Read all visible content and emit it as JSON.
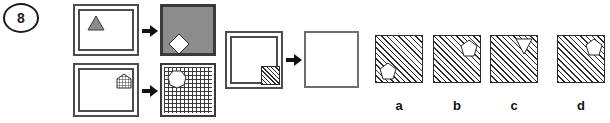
{
  "question": {
    "number": "8",
    "type": "visual-analogy-matrix"
  },
  "examples": [
    {
      "id": "example-1",
      "source": {
        "frame": "double-border-square",
        "fill": "white",
        "shape": "triangle-up",
        "shape_fill": "gray",
        "shape_position": "upper-left"
      },
      "target": {
        "frame": "thick-border-square",
        "fill": "gray",
        "shape": "diamond",
        "shape_fill": "white",
        "shape_position": "lower-left"
      },
      "relation": "arrow-right"
    },
    {
      "id": "example-2",
      "source": {
        "frame": "double-border-square",
        "fill": "white",
        "shape": "pentagon-grid",
        "shape_fill": "grid",
        "shape_position": "upper-right"
      },
      "target": {
        "frame": "thin-border-square",
        "fill": "grid",
        "shape": "heptagon",
        "shape_fill": "white",
        "shape_position": "upper-left"
      },
      "relation": "arrow-right"
    }
  ],
  "prompt": {
    "id": "prompt-pair",
    "source": {
      "frame": "double-border-square",
      "fill": "white",
      "shape": "square-hatched",
      "shape_fill": "diagonal-hatch",
      "shape_position": "lower-right"
    },
    "target": {
      "frame": "thin-border-square",
      "fill": "white",
      "shape": "none",
      "label": "?"
    },
    "relation": "arrow-right"
  },
  "options": [
    {
      "label": "a",
      "fill": "diagonal-hatch",
      "shape": "pentagon",
      "shape_fill": "white",
      "shape_position": "lower-left"
    },
    {
      "label": "b",
      "fill": "diagonal-hatch",
      "shape": "pentagon",
      "shape_fill": "white",
      "shape_position": "upper-right"
    },
    {
      "label": "c",
      "fill": "diagonal-hatch",
      "shape": "triangle-down",
      "shape_fill": "white",
      "shape_position": "upper-right"
    },
    {
      "label": "d",
      "fill": "diagonal-hatch",
      "shape": "pentagon",
      "shape_fill": "white",
      "shape_position": "upper-right"
    }
  ],
  "colors": {
    "ink": "#1a1a1a",
    "frame": "#4d4d4d",
    "frame_light": "#6e6e6e",
    "gray_fill": "#8c8c8c",
    "hatch": "#2b2b2b",
    "background": "#ffffff"
  }
}
